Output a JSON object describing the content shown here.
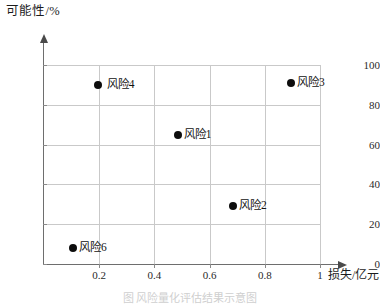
{
  "chart_data": {
    "type": "scatter",
    "title": "",
    "xlabel": "损失/亿元",
    "ylabel": "可能性/%",
    "xlim": [
      0,
      1.05
    ],
    "ylim": [
      0,
      112
    ],
    "grid": true,
    "legend": "none",
    "xticks": [
      "0.2",
      "0.4",
      "0.6",
      "0.8",
      "1"
    ],
    "xtick_values": [
      0.2,
      0.4,
      0.6,
      0.8,
      1.0
    ],
    "yticks": [
      "0",
      "20",
      "40",
      "60",
      "80",
      "100"
    ],
    "ytick_values": [
      0,
      20,
      40,
      60,
      80,
      100
    ],
    "points": [
      {
        "label": "风险4",
        "x": 0.195,
        "y": 90,
        "label_side": "right-gap"
      },
      {
        "label": "风险3",
        "x": 0.895,
        "y": 91,
        "label_side": "right"
      },
      {
        "label": "风险1",
        "x": 0.485,
        "y": 65,
        "label_side": "right"
      },
      {
        "label": "风险2",
        "x": 0.685,
        "y": 29,
        "label_side": "right"
      },
      {
        "label": "风险6",
        "x": 0.105,
        "y": 8,
        "label_side": "right"
      }
    ]
  },
  "caption": {
    "text": "图    风险量化评估结果示意图"
  },
  "colors": {
    "marker": "#0d0d0d",
    "grid": "#c9c9c9",
    "axis": "#6e6e6e",
    "text": "#1a1a1a",
    "background": "#ffffff"
  }
}
